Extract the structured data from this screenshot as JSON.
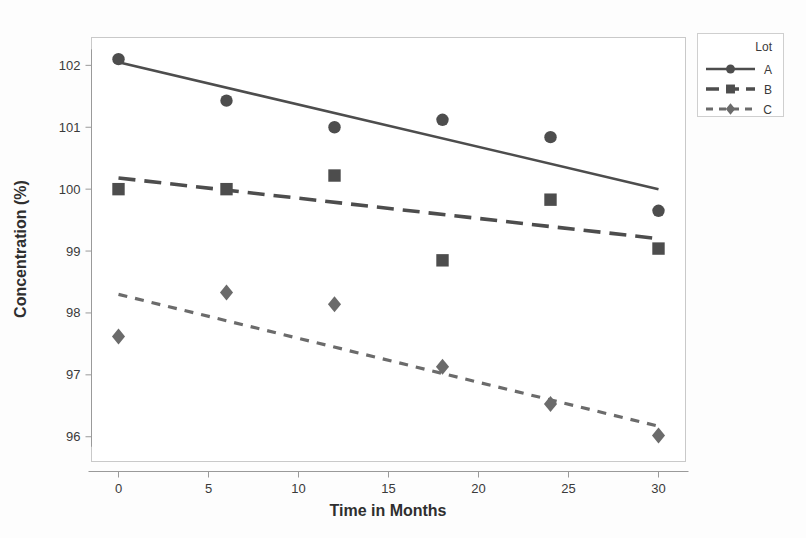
{
  "chart_data": {
    "type": "scatter",
    "title": "",
    "xlabel": "Time in Months",
    "ylabel": "Concentration (%)",
    "xlim": [
      -1.5,
      31.5
    ],
    "ylim": [
      95.6,
      102.45
    ],
    "xticks": [
      0,
      5,
      10,
      15,
      20,
      25,
      30
    ],
    "xtick_labels": [
      "0",
      "5",
      "10",
      "15",
      "20",
      "25",
      "30"
    ],
    "yticks": [
      96,
      97,
      98,
      99,
      100,
      101,
      102
    ],
    "ytick_labels": [
      "96",
      "97",
      "98",
      "99",
      "100",
      "101",
      "102"
    ],
    "grid": false,
    "legend_position": "top-right",
    "legend_title": "Lot",
    "x": [
      0,
      6,
      12,
      18,
      24,
      30
    ],
    "series": [
      {
        "name": "A",
        "marker": "circle",
        "linestyle": "solid",
        "color": "#4d4d4d",
        "values": [
          102.1,
          101.43,
          101.0,
          101.12,
          100.84,
          99.65
        ],
        "fit_start": 102.05,
        "fit_end": 100.0
      },
      {
        "name": "B",
        "marker": "square",
        "linestyle": "dashed",
        "color": "#4d4d4d",
        "values": [
          100.0,
          100.0,
          100.22,
          98.85,
          99.83,
          99.04
        ],
        "fit_start": 100.18,
        "fit_end": 99.2
      },
      {
        "name": "C",
        "marker": "diamond",
        "linestyle": "dotted",
        "color": "#6b6b6b",
        "values": [
          97.62,
          98.33,
          98.14,
          97.13,
          96.53,
          96.02
        ],
        "fit_start": 98.3,
        "fit_end": 96.17
      }
    ]
  },
  "axes": {
    "x_title": "Time in Months",
    "y_title": "Concentration (%)"
  },
  "legend": {
    "title": "Lot",
    "entries": [
      {
        "label": "A"
      },
      {
        "label": "B"
      },
      {
        "label": "C"
      }
    ]
  },
  "ticks": {
    "x": [
      "0",
      "5",
      "10",
      "15",
      "20",
      "25",
      "30"
    ],
    "y": [
      "96",
      "97",
      "98",
      "99",
      "100",
      "101",
      "102"
    ]
  },
  "colors": {
    "series_a": "#4d4d4d",
    "series_b": "#4d4d4d",
    "series_c": "#6b6b6b",
    "frame": "#c9c9c9",
    "text": "#333333",
    "background": "#fdfdfd"
  }
}
